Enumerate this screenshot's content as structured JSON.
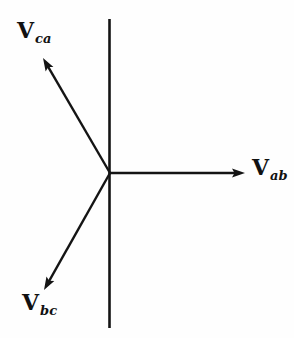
{
  "diagram": {
    "background_color": "#fefefe",
    "stroke_color": "#141414",
    "origin": {
      "x": 110,
      "y": 173
    },
    "axis_line": {
      "x": 109.5,
      "y1": 19,
      "y2": 328
    },
    "arrow": {
      "head_length": 13,
      "head_width": 9,
      "stroke_width": 2.4,
      "axis_stroke_width": 2.6
    },
    "vectors": [
      {
        "name": "V_ca",
        "label_main": "V",
        "label_sub": "ca",
        "angle_deg": 120,
        "tip": {
          "x": 43,
          "y": 58
        },
        "label_pos": {
          "x": 17,
          "y": 19
        }
      },
      {
        "name": "V_ab",
        "label_main": "V",
        "label_sub": "ab",
        "angle_deg": 0,
        "tip": {
          "x": 245,
          "y": 173
        },
        "label_pos": {
          "x": 252,
          "y": 156
        }
      },
      {
        "name": "V_bc",
        "label_main": "V",
        "label_sub": "bc",
        "angle_deg": 240,
        "tip": {
          "x": 44,
          "y": 290
        },
        "label_pos": {
          "x": 22,
          "y": 291
        }
      }
    ]
  }
}
